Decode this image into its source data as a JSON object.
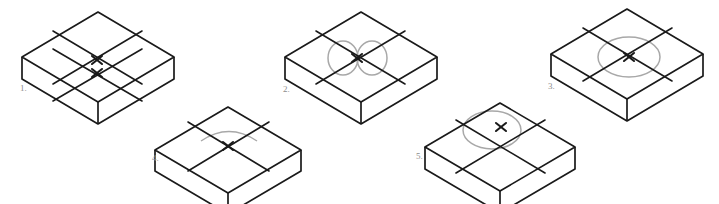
{
  "drawing": {
    "title": "Isometric box centerline and ellipse construction exercise",
    "background_color": "#ffffff",
    "line_color": "#1a1a1a",
    "construction_color": "#a8a8a8",
    "label_color": "#8d8d8d",
    "figure_count": 5
  },
  "figures": [
    {
      "id": "figure-1",
      "label": "1.",
      "label_x": 20,
      "label_y": 91,
      "description": "isometric box with two offset centerline cross marks and no ellipse",
      "ellipse_type": "none",
      "cross_marks": 2,
      "box": {
        "top_n_x": 98,
        "top_n_y": 12,
        "top_w_x": 22,
        "top_w_y": 57,
        "top_s_x": 98,
        "top_s_y": 102,
        "top_e_x": 174,
        "top_e_y": 57,
        "depth": 22
      },
      "crosses": [
        {
          "x": 97,
          "y": 60
        },
        {
          "x": 97,
          "y": 73
        }
      ],
      "centerlines": [
        {
          "x1": 53,
          "y1": 31,
          "x2": 142,
          "y2": 84
        },
        {
          "x1": 53,
          "y1": 49,
          "x2": 142,
          "y2": 101
        },
        {
          "x1": 53,
          "y1": 84,
          "x2": 142,
          "y2": 31
        },
        {
          "x1": 53,
          "y1": 101,
          "x2": 142,
          "y2": 49
        }
      ]
    },
    {
      "id": "figure-2",
      "label": "2.",
      "label_x": 283,
      "label_y": 92,
      "description": "isometric box with centerline cross and two vertical circular arcs instead of a true isometric ellipse",
      "ellipse_type": "two-arcs",
      "cross_marks": 1,
      "box": {
        "top_n_x": 361,
        "top_n_y": 12,
        "top_w_x": 285,
        "top_w_y": 57,
        "top_s_x": 361,
        "top_s_y": 102,
        "top_e_x": 437,
        "top_e_y": 57,
        "depth": 22
      },
      "crosses": [
        {
          "x": 357,
          "y": 58
        }
      ],
      "centerlines": [
        {
          "x1": 316,
          "y1": 31,
          "x2": 405,
          "y2": 84
        },
        {
          "x1": 316,
          "y1": 84,
          "x2": 405,
          "y2": 31
        }
      ],
      "arcs": [
        {
          "cx": 343,
          "cy": 58,
          "rx": 15,
          "ry": 17
        },
        {
          "cx": 372,
          "cy": 58,
          "rx": 15,
          "ry": 17
        }
      ]
    },
    {
      "id": "figure-3",
      "label": "3.",
      "label_x": 548,
      "label_y": 89,
      "description": "isometric box with centerline cross and a correctly constructed horizontal isometric ellipse",
      "ellipse_type": "full-ellipse",
      "cross_marks": 1,
      "box": {
        "top_n_x": 627,
        "top_n_y": 9,
        "top_w_x": 551,
        "top_w_y": 54,
        "top_s_x": 627,
        "top_s_y": 99,
        "top_e_x": 703,
        "top_e_y": 54,
        "depth": 22
      },
      "crosses": [
        {
          "x": 629,
          "y": 57
        }
      ],
      "centerlines": [
        {
          "x1": 583,
          "y1": 28,
          "x2": 672,
          "y2": 81
        },
        {
          "x1": 583,
          "y1": 81,
          "x2": 672,
          "y2": 28
        }
      ],
      "ellipse": {
        "cx": 629,
        "cy": 57,
        "rx": 31,
        "ry": 20,
        "rotate": 0
      }
    },
    {
      "id": "figure-4",
      "label": "4.",
      "label_x": 152,
      "label_y": 161,
      "description": "isometric box with centerline cross and only a shallow upper arc, incomplete ellipse",
      "ellipse_type": "top-arc-only",
      "cross_marks": 1,
      "box": {
        "top_n_x": 228,
        "top_n_y": 107,
        "top_w_x": 155,
        "top_w_y": 150,
        "top_s_x": 228,
        "top_s_y": 193,
        "top_e_x": 301,
        "top_e_y": 150,
        "depth": 21
      },
      "crosses": [
        {
          "x": 228,
          "y": 146
        }
      ],
      "centerlines": [
        {
          "x1": 188,
          "y1": 122,
          "x2": 269,
          "y2": 171
        },
        {
          "x1": 188,
          "y1": 171,
          "x2": 269,
          "y2": 122
        }
      ],
      "arc_path": "M 201 141 Q 229 122 257 141"
    },
    {
      "id": "figure-5",
      "label": "5.",
      "label_x": 416,
      "label_y": 159,
      "description": "isometric box with centerline cross and a horizontal ellipse offset left of the cross center",
      "ellipse_type": "offset-ellipse",
      "cross_marks": 1,
      "box": {
        "top_n_x": 500,
        "top_n_y": 103,
        "top_w_x": 425,
        "top_w_y": 147,
        "top_s_x": 500,
        "top_s_y": 191,
        "top_e_x": 575,
        "top_e_y": 147,
        "depth": 22
      },
      "crosses": [
        {
          "x": 501,
          "y": 127
        }
      ],
      "centerlines": [
        {
          "x1": 456,
          "y1": 120,
          "x2": 545,
          "y2": 173
        },
        {
          "x1": 456,
          "y1": 173,
          "x2": 545,
          "y2": 120
        }
      ],
      "ellipse": {
        "cx": 492,
        "cy": 130,
        "rx": 29,
        "ry": 19,
        "rotate": 0
      }
    }
  ]
}
